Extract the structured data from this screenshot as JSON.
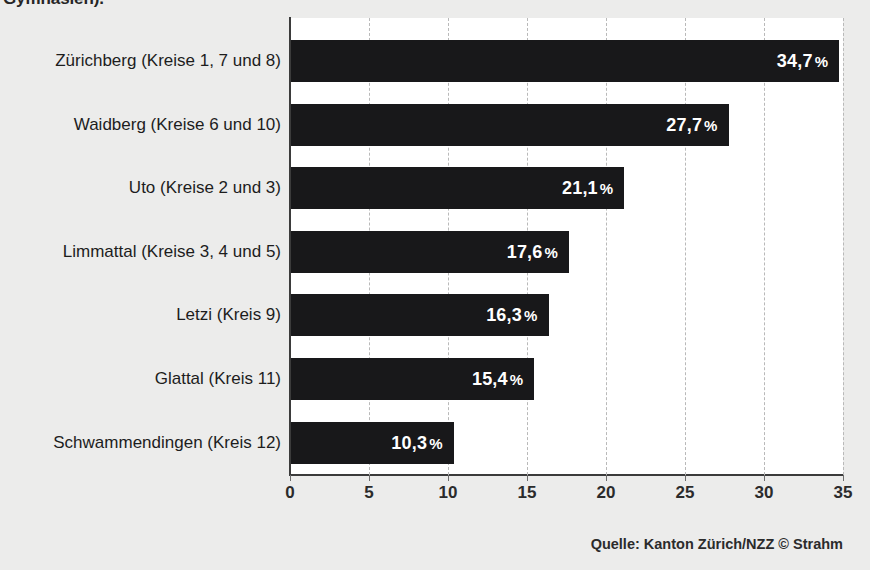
{
  "figure": {
    "clipped_headline": "Gymnasien).",
    "source_note": "Quelle: Kanton Zürich/NZZ  © Strahm"
  },
  "chart_data": {
    "type": "bar",
    "orientation": "horizontal",
    "title": "Gymnasien).",
    "xlabel": "",
    "ylabel": "",
    "xlim": [
      0,
      35
    ],
    "grid": true,
    "legend": null,
    "unit": "%",
    "decimal_separator": ",",
    "categories": [
      "Zürichberg (Kreise 1, 7 und 8)",
      "Waidberg (Kreise 6 und 10)",
      "Uto (Kreise 2 und 3)",
      "Limmattal (Kreise 3, 4 und 5)",
      "Letzi (Kreis 9)",
      "Glattal (Kreis 11)",
      "Schwammendingen (Kreis 12)"
    ],
    "values": [
      34.7,
      27.7,
      21.1,
      17.6,
      16.3,
      15.4,
      10.3
    ],
    "value_labels": [
      "34,7",
      "27,7",
      "21,1",
      "17,6",
      "16,3",
      "15,4",
      "10,3"
    ],
    "percent_symbol": "%",
    "xticks": [
      0,
      5,
      10,
      15,
      20,
      25,
      30,
      35
    ],
    "xtick_labels": [
      "0",
      "5",
      "10",
      "15",
      "20",
      "25",
      "30",
      "35"
    ],
    "bar_color": "#18181a",
    "plot_background": "#ffffff",
    "page_background": "#ececeb",
    "label_color": "#ffffff"
  }
}
